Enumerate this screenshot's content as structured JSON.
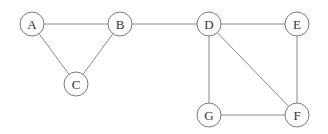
{
  "graph": {
    "nodes": [
      {
        "id": "A",
        "label": "A",
        "x": 32,
        "y": 24
      },
      {
        "id": "B",
        "label": "B",
        "x": 120,
        "y": 24
      },
      {
        "id": "C",
        "label": "C",
        "x": 76,
        "y": 84
      },
      {
        "id": "D",
        "label": "D",
        "x": 209,
        "y": 24
      },
      {
        "id": "E",
        "label": "E",
        "x": 297,
        "y": 24
      },
      {
        "id": "F",
        "label": "F",
        "x": 297,
        "y": 115
      },
      {
        "id": "G",
        "label": "G",
        "x": 209,
        "y": 115
      }
    ],
    "edges": [
      [
        "A",
        "B"
      ],
      [
        "A",
        "C"
      ],
      [
        "B",
        "C"
      ],
      [
        "B",
        "D"
      ],
      [
        "D",
        "E"
      ],
      [
        "D",
        "G"
      ],
      [
        "D",
        "F"
      ],
      [
        "E",
        "F"
      ],
      [
        "G",
        "F"
      ]
    ],
    "node_radius": 12
  }
}
